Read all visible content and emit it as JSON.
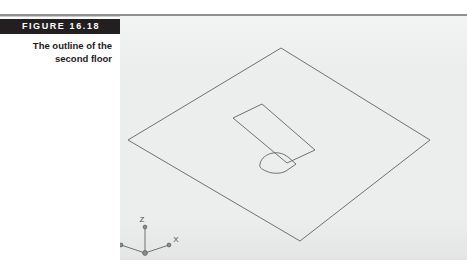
{
  "figure": {
    "number_label": "FIGURE  16.18",
    "caption_line1": "The outline of the",
    "caption_line2": "second floor"
  },
  "colors": {
    "label_bar_bg": "#231f20",
    "label_bar_text": "#ffffff",
    "panel_bg": "#eceded",
    "line_stroke": "#6f7175",
    "rule": "#8e9094",
    "caption_text": "#1b1b1b"
  },
  "drawing": {
    "type": "cad-isometric-floor-outline",
    "ucs_icon": {
      "axis_x_label": "X",
      "axis_y_label": "Y",
      "axis_z_label": "Z"
    },
    "shapes": {
      "floor_outline": "large isometric diamond (second floor slab outline)",
      "stairwell_opening": "elongated isometric rectangle opening",
      "rounded_opening": "small rounded isometric opening"
    }
  }
}
